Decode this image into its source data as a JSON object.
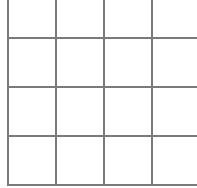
{
  "board": {
    "rows": 4,
    "columns": 4,
    "line_color": "#7a7a7a",
    "cell_color": "#ffffff",
    "cells": [
      [
        "",
        "",
        "",
        ""
      ],
      [
        "",
        "",
        "",
        ""
      ],
      [
        "",
        "",
        "",
        ""
      ],
      [
        "",
        "",
        "",
        ""
      ]
    ]
  }
}
